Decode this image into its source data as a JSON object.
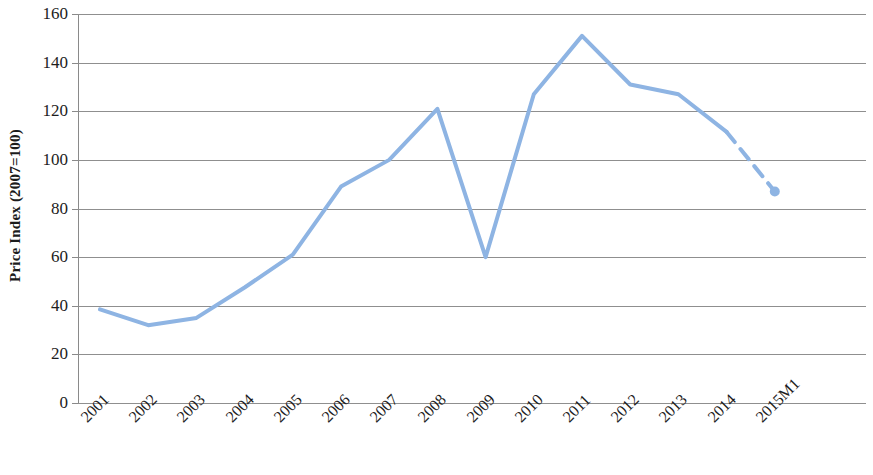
{
  "chart_data": {
    "type": "line",
    "title": "",
    "xlabel": "",
    "ylabel": "Price Index (2007=100)",
    "ylim": [
      0,
      160
    ],
    "ytick_labels": [
      "160",
      "140",
      "120",
      "100",
      "80",
      "60",
      "40",
      "20",
      "0"
    ],
    "yticks": [
      160,
      140,
      120,
      100,
      80,
      60,
      40,
      20,
      0
    ],
    "grid": true,
    "legend": "none",
    "categories": [
      "2001",
      "2002",
      "2003",
      "2004",
      "2005",
      "2006",
      "2007",
      "2008",
      "2009",
      "2010",
      "2011",
      "2012",
      "2013",
      "2014",
      "2015M1"
    ],
    "values": [
      38.5,
      32.0,
      35.0,
      47.5,
      61.0,
      89.0,
      100.0,
      121.0,
      60.0,
      127.0,
      151.0,
      131.0,
      127.0,
      111.5,
      87.0
    ],
    "series": [
      {
        "name": "Price Index",
        "color": "#8EB4E3",
        "values": [
          38.5,
          32.0,
          35.0,
          47.5,
          61.0,
          89.0,
          100.0,
          121.0,
          60.0,
          127.0,
          151.0,
          131.0,
          127.0,
          111.5,
          87.0
        ]
      }
    ],
    "dashed_from_index": 13,
    "marker_index": 14,
    "marker_value": 87.0,
    "line_color": "#8EB4E3",
    "grid_color": "#8f8f8f",
    "axis_color": "#8a8a8a"
  }
}
